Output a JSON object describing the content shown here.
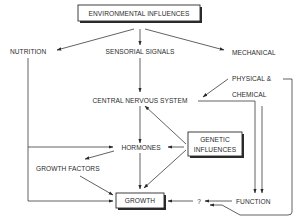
{
  "diagram": {
    "nodes": {
      "environmental": "ENVIRONMENTAL INFLUENCES",
      "nutrition": "NUTRITION",
      "sensorial": "SENSORIAL SIGNALS",
      "mechanical": "MECHANICAL",
      "physical": "PHYSICAL &",
      "chemical": "CHEMICAL",
      "cns": "CENTRAL NERVOUS SYSTEM",
      "genetic_1": "GENETIC",
      "genetic_2": "INFLUENCES",
      "hormones": "HORMONES",
      "growth_factors": "GROWTH FACTORS",
      "growth": "GROWTH",
      "question": "?",
      "function": "FUNCTION"
    },
    "edges": [
      {
        "from": "ENVIRONMENTAL INFLUENCES",
        "to": "NUTRITION"
      },
      {
        "from": "ENVIRONMENTAL INFLUENCES",
        "to": "SENSORIAL SIGNALS"
      },
      {
        "from": "ENVIRONMENTAL INFLUENCES",
        "to": "MECHANICAL"
      },
      {
        "from": "SENSORIAL SIGNALS",
        "to": "CENTRAL NERVOUS SYSTEM"
      },
      {
        "from": "PHYSICAL & CHEMICAL",
        "to": "CENTRAL NERVOUS SYSTEM"
      },
      {
        "from": "CENTRAL NERVOUS SYSTEM",
        "to": "FUNCTION"
      },
      {
        "from": "CENTRAL NERVOUS SYSTEM",
        "to": "HORMONES"
      },
      {
        "from": "CHEMICAL",
        "to": "FUNCTION"
      },
      {
        "from": "PHYSICAL &",
        "to": "?"
      },
      {
        "from": "GENETIC INFLUENCES",
        "to": "CENTRAL NERVOUS SYSTEM"
      },
      {
        "from": "GENETIC INFLUENCES",
        "to": "HORMONES"
      },
      {
        "from": "GENETIC INFLUENCES",
        "to": "GROWTH"
      },
      {
        "from": "NUTRITION",
        "to": "HORMONES"
      },
      {
        "from": "NUTRITION",
        "to": "GROWTH"
      },
      {
        "from": "HORMONES",
        "to": "GROWTH FACTORS"
      },
      {
        "from": "HORMONES",
        "to": "GROWTH"
      },
      {
        "from": "GROWTH FACTORS",
        "to": "GROWTH"
      },
      {
        "from": "FUNCTION",
        "to": "?"
      },
      {
        "from": "?",
        "to": "GROWTH"
      }
    ]
  }
}
